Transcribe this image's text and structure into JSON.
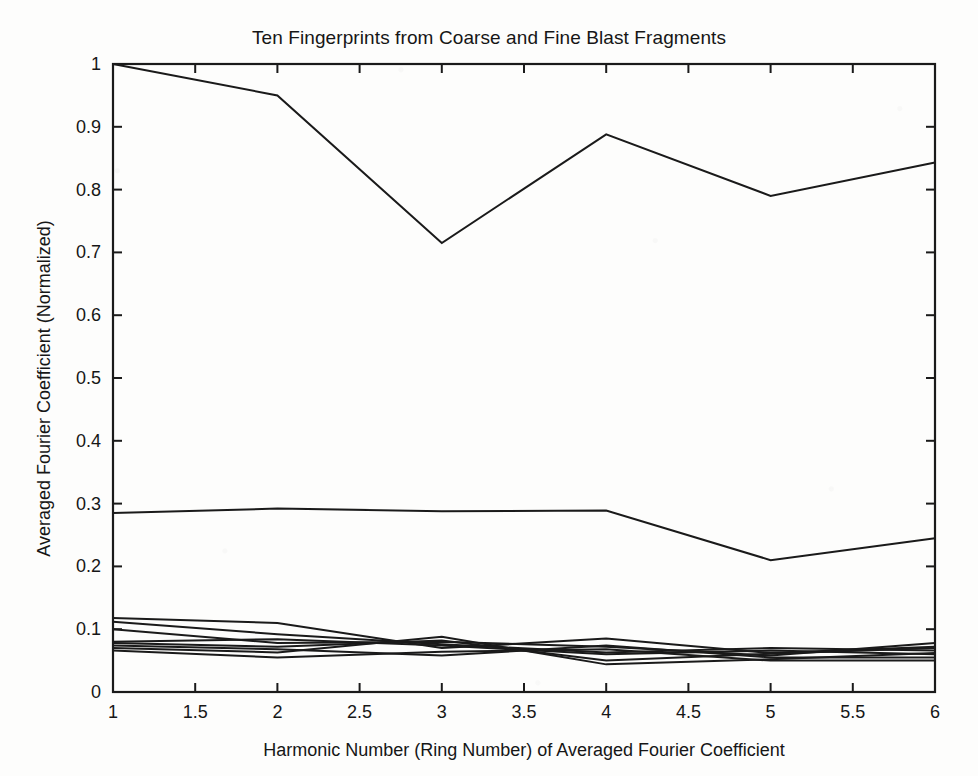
{
  "chart_data": {
    "type": "line",
    "title": "Ten Fingerprints from Coarse and Fine Blast Fragments",
    "xlabel": "Harmonic Number (Ring Number) of Averaged Fourier Coefficient",
    "ylabel": "Averaged Fourier Coefficient (Normalized)",
    "x": [
      1,
      2,
      3,
      4,
      5,
      6
    ],
    "xlim": [
      1,
      6
    ],
    "ylim": [
      0,
      1
    ],
    "xticks": [
      "1",
      "1.5",
      "2",
      "2.5",
      "3",
      "3.5",
      "4",
      "4.5",
      "5",
      "5.5",
      "6"
    ],
    "xtick_values": [
      1,
      1.5,
      2,
      2.5,
      3,
      3.5,
      4,
      4.5,
      5,
      5.5,
      6
    ],
    "yticks": [
      "0",
      "0.1",
      "0.2",
      "0.3",
      "0.4",
      "0.5",
      "0.6",
      "0.7",
      "0.8",
      "0.9",
      "1"
    ],
    "ytick_values": [
      0,
      0.1,
      0.2,
      0.3,
      0.4,
      0.5,
      0.6,
      0.7,
      0.8,
      0.9,
      1
    ],
    "grid": false,
    "legend": "none",
    "line_color": "#1a1a1a",
    "series": [
      {
        "name": "fingerprint-1",
        "values": [
          1.0,
          0.95,
          0.715,
          0.888,
          0.79,
          0.843
        ]
      },
      {
        "name": "fingerprint-2",
        "values": [
          0.285,
          0.292,
          0.288,
          0.289,
          0.21,
          0.245
        ]
      },
      {
        "name": "fingerprint-3",
        "values": [
          0.118,
          0.11,
          0.07,
          0.085,
          0.062,
          0.072
        ]
      },
      {
        "name": "fingerprint-4",
        "values": [
          0.112,
          0.092,
          0.076,
          0.063,
          0.07,
          0.066
        ]
      },
      {
        "name": "fingerprint-5",
        "values": [
          0.1,
          0.078,
          0.08,
          0.072,
          0.058,
          0.078
        ]
      },
      {
        "name": "fingerprint-6",
        "values": [
          0.08,
          0.084,
          0.074,
          0.06,
          0.066,
          0.06
        ]
      },
      {
        "name": "fingerprint-7",
        "values": [
          0.078,
          0.072,
          0.082,
          0.05,
          0.061,
          0.07
        ]
      },
      {
        "name": "fingerprint-8",
        "values": [
          0.074,
          0.068,
          0.058,
          0.074,
          0.055,
          0.055
        ]
      },
      {
        "name": "fingerprint-9",
        "values": [
          0.07,
          0.063,
          0.088,
          0.044,
          0.052,
          0.062
        ]
      },
      {
        "name": "fingerprint-10",
        "values": [
          0.066,
          0.055,
          0.064,
          0.068,
          0.05,
          0.05
        ]
      }
    ]
  },
  "axes": {
    "frame_color": "#1a1a1a"
  }
}
